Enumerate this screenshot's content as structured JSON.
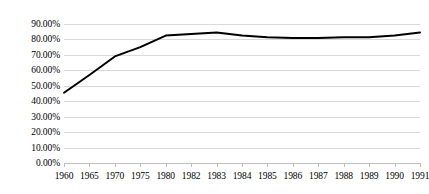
{
  "chart_data": {
    "type": "line",
    "title": "",
    "subtitle": "",
    "xlabel": "",
    "ylabel": "",
    "categories": [
      "1960",
      "1965",
      "1970",
      "1975",
      "1980",
      "1982",
      "1983",
      "1984",
      "1985",
      "1986",
      "1987",
      "1988",
      "1989",
      "1990",
      "1991"
    ],
    "series": [
      {
        "name": "",
        "values": [
          45.5,
          57.0,
          69.0,
          75.0,
          82.5,
          83.5,
          84.5,
          82.5,
          81.5,
          81.0,
          81.0,
          81.5,
          81.5,
          82.5,
          84.5
        ]
      }
    ],
    "ylim": [
      0,
      90
    ],
    "ytick_values": [
      0,
      10,
      20,
      30,
      40,
      50,
      60,
      70,
      80,
      90
    ],
    "ytick_labels": [
      "0.00%",
      "10.00%",
      "20.00%",
      "30.00%",
      "40.00%",
      "50.00%",
      "60.00%",
      "70.00%",
      "80.00%",
      "90.00%"
    ],
    "grid": true,
    "legend": "none",
    "line_color": "#000000",
    "gridline_color": "#d9d9d9",
    "axis_color": "#bfbfbf",
    "background_color": "#ffffff"
  }
}
